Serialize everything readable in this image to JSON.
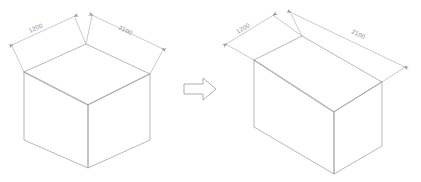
{
  "document": {
    "title": "Isometric Box Transformation Diagram",
    "background_color": "#ffffff",
    "line_color": "#9a9a9a",
    "dim_line_color": "#a6a6a6",
    "text_color": "#8c8c8c",
    "watermark_color": "#fbfbfb"
  },
  "figures": [
    {
      "id": "left-box",
      "name": "Isometric rectangular box (before)",
      "dimensions": [
        {
          "label": "1200",
          "placement": "top-left-edge",
          "axis": "width"
        },
        {
          "label": "2100",
          "placement": "top-right-edge",
          "axis": "length"
        }
      ]
    },
    {
      "id": "right-box",
      "name": "Isometric rectangular box (after)",
      "dimensions": [
        {
          "label": "1200",
          "placement": "top-left-edge",
          "axis": "width"
        },
        {
          "label": "2100",
          "placement": "top-right-edge",
          "axis": "length"
        }
      ]
    }
  ],
  "connector": {
    "name": "transformation-arrow",
    "direction": "right",
    "style": "hollow-outline-block-arrow",
    "label": ""
  },
  "watermark": {
    "text": "",
    "visible": true
  }
}
